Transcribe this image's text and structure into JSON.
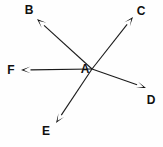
{
  "figure": {
    "kind": "vector-diagram",
    "width": 163,
    "height": 147,
    "background_color": "#fefefe",
    "line_color": "#1a1a1a",
    "label_color": "#101010"
  },
  "origin": {
    "id": "A",
    "label": "A",
    "label_x": 85,
    "label_y": 69,
    "x": 92,
    "y": 69
  },
  "vectors": [
    {
      "id": "B",
      "label": "B",
      "tail_x": 92,
      "tail_y": 69,
      "tip_x": 37,
      "tip_y": 19,
      "label_x": 29,
      "label_y": 10
    },
    {
      "id": "C",
      "label": "C",
      "tail_x": 92,
      "tail_y": 69,
      "tip_x": 133,
      "tip_y": 17,
      "label_x": 141,
      "label_y": 11
    },
    {
      "id": "D",
      "label": "D",
      "tail_x": 92,
      "tail_y": 69,
      "tip_x": 146,
      "tip_y": 88,
      "label_x": 151,
      "label_y": 100
    },
    {
      "id": "E",
      "label": "E",
      "tail_x": 92,
      "tail_y": 69,
      "tip_x": 56,
      "tip_y": 123,
      "label_x": 46,
      "label_y": 131
    },
    {
      "id": "F",
      "label": "F",
      "tail_x": 92,
      "tail_y": 69,
      "tip_x": 21,
      "tip_y": 70,
      "label_x": 11,
      "label_y": 70
    }
  ]
}
